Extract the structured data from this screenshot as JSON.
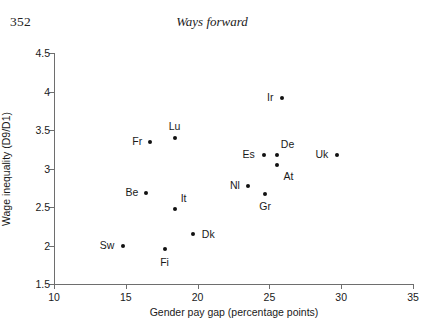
{
  "page": {
    "number": "352",
    "running_title": "Ways forward"
  },
  "chart_data": {
    "type": "scatter",
    "title": "",
    "xlabel": "Gender pay gap (percentage points)",
    "ylabel": "Wage inequality (D9/D1)",
    "xlim": [
      10,
      35
    ],
    "ylim": [
      1.5,
      4.5
    ],
    "xticks": [
      10,
      15,
      20,
      25,
      30,
      35
    ],
    "xtick_labels": [
      "10",
      "15",
      "20",
      "25",
      "30",
      "35"
    ],
    "yticks": [
      1.5,
      2,
      2.5,
      3,
      3.5,
      4,
      4.5
    ],
    "ytick_labels": [
      "1.5",
      "2",
      "2.5",
      "3",
      "3.5",
      "4",
      "4.5"
    ],
    "grid": false,
    "legend": "none",
    "marker": "filled-circle",
    "marker_color": "#111111",
    "axis_color": "#6e6e6e",
    "points": [
      {
        "label": "Sw",
        "x": 14.8,
        "y": 2.0,
        "label_dx": -16,
        "label_dy": -1
      },
      {
        "label": "Be",
        "x": 16.4,
        "y": 2.68,
        "label_dx": -14,
        "label_dy": -1
      },
      {
        "label": "Fr",
        "x": 16.7,
        "y": 3.35,
        "label_dx": -13,
        "label_dy": -1
      },
      {
        "label": "Fi",
        "x": 17.7,
        "y": 1.96,
        "label_dx": 0,
        "label_dy": 13
      },
      {
        "label": "Lu",
        "x": 18.4,
        "y": 3.4,
        "label_dx": 0,
        "label_dy": -12
      },
      {
        "label": "It",
        "x": 18.4,
        "y": 2.48,
        "label_dx": 9,
        "label_dy": -11
      },
      {
        "label": "Dk",
        "x": 19.7,
        "y": 2.15,
        "label_dx": 15,
        "label_dy": 0
      },
      {
        "label": "Nl",
        "x": 23.5,
        "y": 2.77,
        "label_dx": -13,
        "label_dy": -1
      },
      {
        "label": "Es",
        "x": 24.6,
        "y": 3.17,
        "label_dx": -15,
        "label_dy": -1
      },
      {
        "label": "Gr",
        "x": 24.7,
        "y": 2.67,
        "label_dx": 0,
        "label_dy": 12
      },
      {
        "label": "De",
        "x": 25.5,
        "y": 3.17,
        "label_dx": 11,
        "label_dy": -11
      },
      {
        "label": "At",
        "x": 25.5,
        "y": 3.05,
        "label_dx": 12,
        "label_dy": 11
      },
      {
        "label": "Ir",
        "x": 25.9,
        "y": 3.92,
        "label_dx": -12,
        "label_dy": -1
      },
      {
        "label": "Uk",
        "x": 29.7,
        "y": 3.18,
        "label_dx": -15,
        "label_dy": -1
      }
    ]
  }
}
